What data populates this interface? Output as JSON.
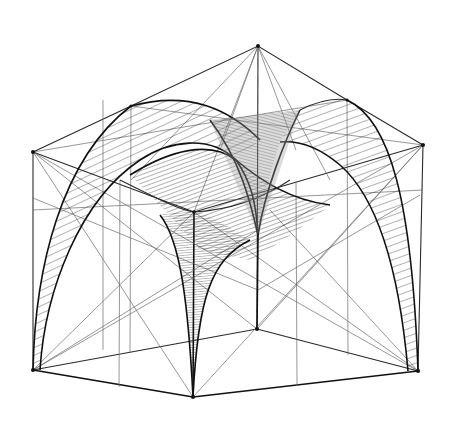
{
  "drawing": {
    "title": "Perspective sketch of a groined vault within a cube frame",
    "medium": "pen-and-ink line drawing",
    "background_color": "#ffffff",
    "ink_color": "#111111",
    "hatch_color": "#1a1a1a",
    "vertices": {
      "top_apex": [
        258,
        46
      ],
      "top_left": [
        33,
        152
      ],
      "top_right": [
        423,
        145
      ],
      "top_front": [
        194,
        212
      ],
      "bottom_left": [
        33,
        370
      ],
      "bottom_front": [
        193,
        397
      ],
      "bottom_right": [
        418,
        371
      ],
      "bottom_back": [
        257,
        329
      ],
      "mid_back_left": [
        131,
        106
      ],
      "mid_back_right": [
        347,
        100
      ]
    },
    "elements": [
      "cube-wireframe",
      "diagonal-construction-lines",
      "left-arch-band",
      "right-arch-band",
      "central-groin-surfaces",
      "front-pendentive",
      "back-pendentive"
    ]
  }
}
